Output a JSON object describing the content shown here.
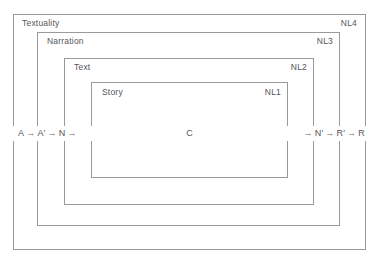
{
  "diagram": {
    "line_color": "#9a9a9a",
    "text_color": "#55555a",
    "background": "#ffffff",
    "boxes": [
      {
        "id": "textuality",
        "name_label": "Textuality",
        "level_label": "NL4",
        "nesting_order": 1
      },
      {
        "id": "narration",
        "name_label": "Narration",
        "level_label": "NL3",
        "nesting_order": 2
      },
      {
        "id": "text",
        "name_label": "Text",
        "level_label": "NL2",
        "nesting_order": 3
      },
      {
        "id": "story",
        "name_label": "Story",
        "level_label": "NL1",
        "nesting_order": 4
      }
    ],
    "chain": {
      "left_sequence": [
        {
          "type": "node",
          "text": "A"
        },
        {
          "type": "arrow",
          "text": "→"
        },
        {
          "type": "node",
          "text": "A′"
        },
        {
          "type": "arrow",
          "text": "→"
        },
        {
          "type": "node",
          "text": "N"
        },
        {
          "type": "arrow",
          "text": "→"
        }
      ],
      "center": "C",
      "right_sequence": [
        {
          "type": "arrow",
          "text": "→"
        },
        {
          "type": "node",
          "text": "N′"
        },
        {
          "type": "arrow",
          "text": "→"
        },
        {
          "type": "node",
          "text": "R′"
        },
        {
          "type": "arrow",
          "text": "→"
        },
        {
          "type": "node",
          "text": "R"
        }
      ]
    }
  }
}
